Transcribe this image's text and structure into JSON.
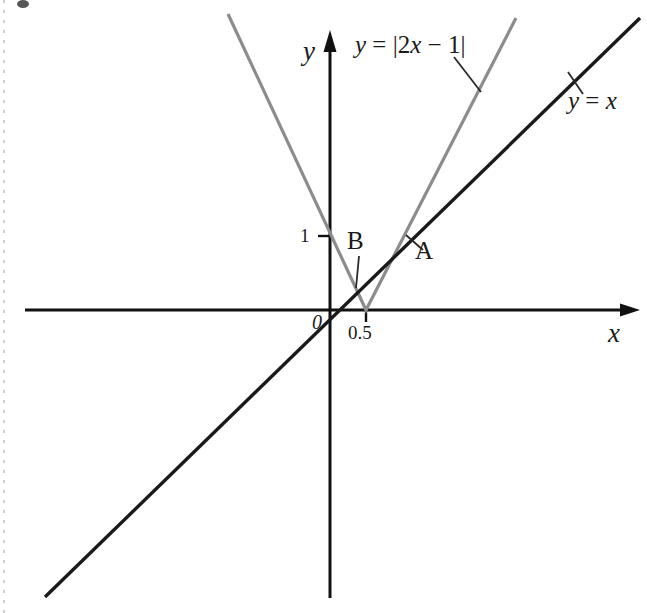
{
  "figure": {
    "title": "",
    "background_color": "#ffffff",
    "width": 647,
    "height": 613
  },
  "axes": {
    "x_axis_label": "x",
    "y_axis_label": "y",
    "origin_label": "0",
    "x_ticks": [
      {
        "label": "0.5",
        "value": 0.5
      }
    ],
    "y_ticks": [
      {
        "label": "1",
        "value": 1
      }
    ],
    "axis_color": "#111111",
    "arrow_x": true,
    "arrow_y": true
  },
  "curves": [
    {
      "name": "identity-line",
      "label": "y = x",
      "label_parts": {
        "lhs": "y",
        "eq": " = ",
        "rhs": "x"
      },
      "color": "#1a1a1a",
      "stroke_width": 3
    },
    {
      "name": "absolute-value-curve",
      "label": "y = |2x − 1|",
      "label_parts": {
        "lhs": "y",
        "eq": " = ",
        "rhs": "|2x − 1|"
      },
      "color": "#8c8c8c",
      "stroke_width": 3,
      "vertex_x": 0.5,
      "vertex_y": 0
    }
  ],
  "points": [
    {
      "name": "point-a",
      "label": "A",
      "x": 1,
      "y": 1
    },
    {
      "name": "point-b",
      "label": "B",
      "x": 0.3333,
      "y": 0.3333
    }
  ],
  "chart_data": {
    "type": "line",
    "title": "",
    "xlabel": "x",
    "ylabel": "y",
    "xlim": [
      -4.1,
      4.05
    ],
    "ylim": [
      -3.9,
      3.62
    ],
    "grid": false,
    "legend": "inline-annotations",
    "series": [
      {
        "name": "y = x",
        "color": "#1a1a1a",
        "equation": "y = x",
        "x": [
          -3.85,
          4.19
        ],
        "values": [
          -3.85,
          4.19
        ]
      },
      {
        "name": "y = |2x - 1|",
        "color": "#8c8c8c",
        "equation": "y = |2x - 1|",
        "x": [
          -0.38,
          0.5,
          1.5
        ],
        "values": [
          1.76,
          0,
          2.0
        ]
      }
    ],
    "annotations": [
      {
        "text": "A",
        "x": 1,
        "y": 1,
        "note": "intersection of y=x and y=2x-1"
      },
      {
        "text": "B",
        "x": 0.3333,
        "y": 0.3333,
        "note": "intersection of y=x and y=1-2x"
      },
      {
        "text": "y = x",
        "x": 3.2,
        "y": 2.75
      },
      {
        "text": "y = |2x - 1|",
        "x": 0.9,
        "y": 3.3
      }
    ],
    "xticks": [
      0.5
    ],
    "xticklabels": [
      "0.5"
    ],
    "yticks": [
      1
    ],
    "yticklabels": [
      "1"
    ]
  }
}
